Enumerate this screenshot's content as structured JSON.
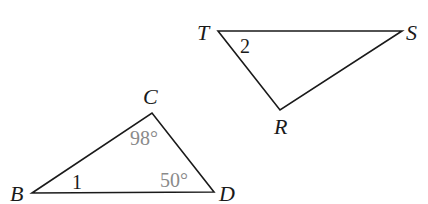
{
  "diagram": {
    "triangles": [
      {
        "name": "BCD",
        "vertices": [
          {
            "label": "B",
            "x": 32,
            "y": 193,
            "lx": 10,
            "ly": 201
          },
          {
            "label": "C",
            "x": 152,
            "y": 113,
            "lx": 143,
            "ly": 104
          },
          {
            "label": "D",
            "x": 214,
            "y": 192,
            "lx": 219,
            "ly": 201
          }
        ],
        "angles": [
          {
            "text": "1",
            "x": 72,
            "y": 189,
            "style": "plain"
          },
          {
            "text": "98°",
            "x": 130,
            "y": 145,
            "style": "degree"
          },
          {
            "text": "50°",
            "x": 160,
            "y": 187,
            "style": "degree"
          }
        ]
      },
      {
        "name": "TSR",
        "vertices": [
          {
            "label": "T",
            "x": 218,
            "y": 31,
            "lx": 197,
            "ly": 40
          },
          {
            "label": "S",
            "x": 402,
            "y": 31,
            "lx": 406,
            "ly": 40
          },
          {
            "label": "R",
            "x": 280,
            "y": 110,
            "lx": 274,
            "ly": 134
          }
        ],
        "angles": [
          {
            "text": "2",
            "x": 240,
            "y": 53,
            "style": "plain"
          }
        ]
      }
    ],
    "colors": {
      "line": "#1a1a1a",
      "degree_text": "#8a8a8a",
      "background": "#ffffff"
    }
  }
}
